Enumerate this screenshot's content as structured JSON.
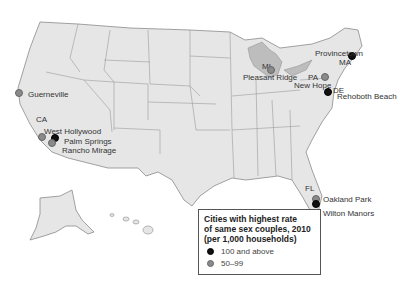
{
  "map": {
    "region": "United States",
    "colors": {
      "land": "#e6e6e6",
      "border": "#8a8a8a",
      "water": "#bdbdbd",
      "high": "#111111",
      "mid": "#8a8a8a"
    }
  },
  "state_labels": [
    {
      "text": "CA",
      "x": 36,
      "y": 115
    },
    {
      "text": "MI",
      "x": 262,
      "y": 62
    },
    {
      "text": "PA",
      "x": 308,
      "y": 73
    },
    {
      "text": "DE",
      "x": 333,
      "y": 86
    },
    {
      "text": "MA",
      "x": 339,
      "y": 58
    },
    {
      "text": "FL",
      "x": 305,
      "y": 184
    }
  ],
  "cities": [
    {
      "name": "Guerneville",
      "category": "mid",
      "dot": {
        "x": 19,
        "y": 93
      },
      "label": {
        "x": 28,
        "y": 90
      }
    },
    {
      "name": "West Hollywood",
      "category": "mid",
      "dot": {
        "x": 42,
        "y": 137
      },
      "label": {
        "x": 44,
        "y": 127
      }
    },
    {
      "name": "Palm Springs",
      "category": "high",
      "dot": {
        "x": 55,
        "y": 138
      },
      "label": {
        "x": 64,
        "y": 137
      }
    },
    {
      "name": "Rancho Mirage",
      "category": "mid",
      "dot": {
        "x": 52,
        "y": 143
      },
      "label": {
        "x": 62,
        "y": 146
      }
    },
    {
      "name": "Pleasant Ridge",
      "category": "mid",
      "dot": {
        "x": 271,
        "y": 70
      },
      "label": {
        "x": 243,
        "y": 73
      }
    },
    {
      "name": "Provincetown",
      "category": "high",
      "dot": {
        "x": 352,
        "y": 56
      },
      "label": {
        "x": 315,
        "y": 49
      }
    },
    {
      "name": "New Hope",
      "category": "mid",
      "dot": {
        "x": 325,
        "y": 77
      },
      "label": {
        "x": 294,
        "y": 81
      }
    },
    {
      "name": "Rehoboth Beach",
      "category": "high",
      "dot": {
        "x": 328,
        "y": 92
      },
      "label": {
        "x": 337,
        "y": 92
      }
    },
    {
      "name": "Oakland Park",
      "category": "mid",
      "dot": {
        "x": 316,
        "y": 199
      },
      "label": {
        "x": 323,
        "y": 195
      }
    },
    {
      "name": "Wilton Manors",
      "category": "high",
      "dot": {
        "x": 316,
        "y": 204
      },
      "label": {
        "x": 323,
        "y": 209
      }
    }
  ],
  "legend": {
    "title_lines": [
      "Cities with highest rate",
      "of same sex couples, 2010",
      "(per 1,000 households)"
    ],
    "items": [
      {
        "label": "100 and above",
        "category": "high"
      },
      {
        "label": "50–99",
        "category": "mid"
      }
    ]
  }
}
